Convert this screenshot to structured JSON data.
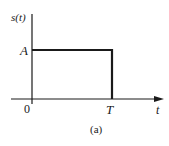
{
  "figure": {
    "caption": "(a)",
    "y_axis_label": "s(t)",
    "x_axis_label": "t",
    "amplitude_label": "A",
    "origin_label": "0",
    "pulse_end_label": "T",
    "stroke_color": "#1a1a1a",
    "background_color": "#ffffff"
  },
  "signal": {
    "type": "rectangular-pulse",
    "amplitude": "A",
    "start": "0",
    "end": "T",
    "description": "s(t) = A for 0 ≤ t ≤ T, 0 otherwise"
  }
}
